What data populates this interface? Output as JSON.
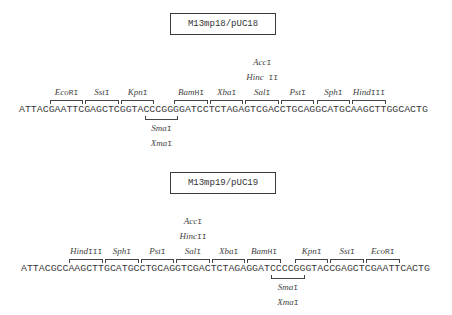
{
  "layout": {
    "char_width": 5.93
  },
  "diagrams": [
    {
      "title": "M13mp18/pUC18",
      "title_box_top": 13,
      "sequence": "ATTACGAATTCGAGCTCGGTACCCGGGGATCCTCTAGAGTCGACCTGCAGGCATGCAAGCTTGGCACTG",
      "seq_left": 19,
      "seq_top": 104,
      "sites_above": [
        {
          "enzyme_italic": "Eco",
          "enzyme_roman": "RI",
          "start": 5,
          "end": 10
        },
        {
          "enzyme_italic": "Sst",
          "enzyme_roman": "I",
          "start": 11,
          "end": 16
        },
        {
          "enzyme_italic": "Kpn",
          "enzyme_roman": "I",
          "start": 17,
          "end": 22
        },
        {
          "enzyme_italic": "Bam",
          "enzyme_roman": "HI",
          "start": 26,
          "end": 31
        },
        {
          "enzyme_italic": "Xba",
          "enzyme_roman": "I",
          "start": 32,
          "end": 37
        },
        {
          "enzyme_italic": "Sal",
          "enzyme_roman": "I",
          "start": 38,
          "end": 43,
          "extra_labels": [
            {
              "enzyme_italic": "Hinc",
              "enzyme_roman": " II"
            },
            {
              "enzyme_italic": "Acc",
              "enzyme_roman": "I"
            }
          ]
        },
        {
          "enzyme_italic": "Pst",
          "enzyme_roman": "I",
          "start": 44,
          "end": 49
        },
        {
          "enzyme_italic": "Sph",
          "enzyme_roman": "I",
          "start": 50,
          "end": 55
        },
        {
          "enzyme_italic": "Hind",
          "enzyme_roman": "III",
          "start": 56,
          "end": 61
        }
      ],
      "sites_below": [
        {
          "start": 21,
          "end": 26,
          "labels": [
            {
              "enzyme_italic": "Sma",
              "enzyme_roman": "I"
            },
            {
              "enzyme_italic": "Xma",
              "enzyme_roman": "I"
            }
          ]
        }
      ]
    },
    {
      "title": "M13mp19/pUC19",
      "title_box_top": 172,
      "sequence": "ATTACGCCAAGCTTGCATGCCTGCAGGTCGACTCTAGAGGATCCCCGGGTACCGAGCTCGAATTCACTG",
      "seq_left": 21,
      "seq_top": 263,
      "sites_above": [
        {
          "enzyme_italic": "Hind",
          "enzyme_roman": "III",
          "start": 8,
          "end": 13
        },
        {
          "enzyme_italic": "Sph",
          "enzyme_roman": "I",
          "start": 14,
          "end": 19
        },
        {
          "enzyme_italic": "Pst",
          "enzyme_roman": "I",
          "start": 20,
          "end": 25
        },
        {
          "enzyme_italic": "Sal",
          "enzyme_roman": "I",
          "start": 26,
          "end": 31,
          "extra_labels": [
            {
              "enzyme_italic": "Hinc",
              "enzyme_roman": "II"
            },
            {
              "enzyme_italic": "Acc",
              "enzyme_roman": "I"
            }
          ]
        },
        {
          "enzyme_italic": "Xba",
          "enzyme_roman": "I",
          "start": 32,
          "end": 37
        },
        {
          "enzyme_italic": "Bam",
          "enzyme_roman": "HI",
          "start": 38,
          "end": 43
        },
        {
          "enzyme_italic": "Kpn",
          "enzyme_roman": "I",
          "start": 46,
          "end": 51
        },
        {
          "enzyme_italic": "Sst",
          "enzyme_roman": "I",
          "start": 52,
          "end": 57
        },
        {
          "enzyme_italic": "Eco",
          "enzyme_roman": "RI",
          "start": 58,
          "end": 63
        }
      ],
      "sites_below": [
        {
          "start": 42,
          "end": 47,
          "labels": [
            {
              "enzyme_italic": "Sma",
              "enzyme_roman": "I"
            },
            {
              "enzyme_italic": "Xma",
              "enzyme_roman": "I"
            }
          ]
        }
      ]
    }
  ]
}
